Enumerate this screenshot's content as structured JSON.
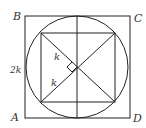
{
  "diagram": {
    "type": "geometry",
    "colors": {
      "stroke": "#222222",
      "label": "#333333",
      "background": "#ffffff"
    },
    "vertices": {
      "B": {
        "label": "B",
        "x": 25,
        "y": 16
      },
      "C": {
        "label": "C",
        "x": 130,
        "y": 16
      },
      "A": {
        "label": "A",
        "x": 25,
        "y": 118
      },
      "D": {
        "label": "D",
        "x": 130,
        "y": 118
      }
    },
    "labels": {
      "B": "B",
      "C": "C",
      "A": "A",
      "D": "D",
      "side": "2k",
      "segment_upper": "k",
      "segment_lower": "k"
    },
    "circle": {
      "cx": 77,
      "cy": 67,
      "r": 51
    },
    "inner_square": {
      "tl": [
        41,
        33
      ],
      "tr": [
        115,
        33
      ],
      "br": [
        115,
        102
      ],
      "bl": [
        41,
        102
      ]
    },
    "right_angle_marker": true
  }
}
